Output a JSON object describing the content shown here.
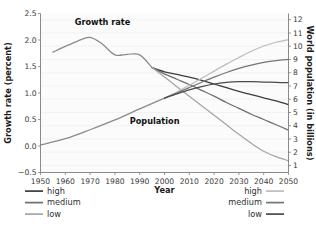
{
  "chart_data": {
    "type": "line",
    "title": "",
    "xlabel": "Year",
    "ylabel": "Growth rate (percent)",
    "y2label": "World population (in billions)",
    "xlim": [
      1950,
      2050
    ],
    "ylim": [
      -0.5,
      2.5
    ],
    "y2lim": [
      0.4705882353,
      12.4705882353
    ],
    "xticks": [
      1950,
      1960,
      1970,
      1980,
      1990,
      2000,
      2010,
      2020,
      2030,
      2040,
      2050
    ],
    "xticklabels": [
      "1950",
      "1960",
      "1970",
      "1980",
      "1990",
      "2000",
      "2010",
      "2020",
      "2030",
      "2040",
      "2050"
    ],
    "yticks": [
      -0.5,
      0.0,
      0.5,
      1.0,
      1.5,
      2.0,
      2.5
    ],
    "yticklabels": [
      "−0.5",
      "0.0",
      "0.5",
      "1.0",
      "1.5",
      "2.0",
      "2.5"
    ],
    "y2ticks": [
      1,
      2,
      3,
      4,
      5,
      6,
      7,
      8,
      9,
      10,
      11,
      12
    ],
    "y2ticklabels": [
      "1",
      "2",
      "3",
      "4",
      "5",
      "6",
      "7",
      "8",
      "9",
      "10",
      "11",
      "12"
    ],
    "grid": "horizontal",
    "annotations": [
      {
        "text": "Growth rate",
        "x": 1975,
        "y": 2.28
      },
      {
        "text": "Population",
        "x": 1996,
        "y": 0.42
      }
    ],
    "series": [
      {
        "name": "growth-rate-historic",
        "group": "growth_rate",
        "variant": "historic",
        "axis": "left",
        "color": "#8a8a8a",
        "x": [
          1955,
          1960,
          1965,
          1970,
          1975,
          1980,
          1985,
          1990,
          1995
        ],
        "values": [
          1.77,
          1.88,
          1.98,
          2.05,
          1.92,
          1.72,
          1.73,
          1.72,
          1.48
        ]
      },
      {
        "name": "growth-rate-high",
        "group": "growth_rate",
        "variant": "high",
        "axis": "left",
        "color": "#3c3c3c",
        "x": [
          1995,
          2000,
          2005,
          2010,
          2015,
          2020,
          2025,
          2030,
          2035,
          2040,
          2045,
          2050
        ],
        "values": [
          1.48,
          1.4,
          1.35,
          1.3,
          1.24,
          1.17,
          1.1,
          1.03,
          0.97,
          0.91,
          0.85,
          0.78
        ]
      },
      {
        "name": "growth-rate-medium",
        "group": "growth_rate",
        "variant": "medium",
        "axis": "left",
        "color": "#6e6e6e",
        "x": [
          1995,
          2000,
          2005,
          2010,
          2015,
          2020,
          2025,
          2030,
          2035,
          2040,
          2045,
          2050
        ],
        "values": [
          1.48,
          1.36,
          1.26,
          1.16,
          1.05,
          0.94,
          0.82,
          0.71,
          0.6,
          0.5,
          0.4,
          0.3
        ]
      },
      {
        "name": "growth-rate-low",
        "group": "growth_rate",
        "variant": "low",
        "axis": "left",
        "color": "#a4a4a4",
        "x": [
          1995,
          2000,
          2005,
          2010,
          2015,
          2020,
          2025,
          2030,
          2035,
          2040,
          2045,
          2050
        ],
        "values": [
          1.48,
          1.3,
          1.12,
          0.94,
          0.76,
          0.58,
          0.4,
          0.22,
          0.05,
          -0.1,
          -0.2,
          -0.28
        ]
      },
      {
        "name": "population-historic",
        "group": "population",
        "variant": "historic",
        "axis": "right",
        "color": "#8a8a8a",
        "x": [
          1950,
          1960,
          1970,
          1980,
          1990,
          2000
        ],
        "values": [
          2.55,
          3.02,
          3.7,
          4.44,
          5.27,
          6.08
        ]
      },
      {
        "name": "population-high",
        "group": "population",
        "variant": "high",
        "axis": "right",
        "color": "#bdbdbd",
        "x": [
          2000,
          2005,
          2010,
          2015,
          2020,
          2025,
          2030,
          2035,
          2040,
          2045,
          2050
        ],
        "values": [
          6.08,
          6.55,
          7.05,
          7.58,
          8.12,
          8.65,
          9.15,
          9.62,
          10.02,
          10.3,
          10.5
        ]
      },
      {
        "name": "population-medium",
        "group": "population",
        "variant": "medium",
        "axis": "right",
        "color": "#757575",
        "x": [
          2000,
          2005,
          2010,
          2015,
          2020,
          2025,
          2030,
          2035,
          2040,
          2045,
          2050
        ],
        "values": [
          6.08,
          6.47,
          6.88,
          7.28,
          7.67,
          8.02,
          8.33,
          8.58,
          8.78,
          8.92,
          9.0
        ]
      },
      {
        "name": "population-low",
        "group": "population",
        "variant": "low",
        "axis": "right",
        "color": "#4a4a4a",
        "x": [
          2000,
          2005,
          2010,
          2015,
          2020,
          2025,
          2030,
          2035,
          2040,
          2045,
          2050
        ],
        "values": [
          6.08,
          6.4,
          6.7,
          6.95,
          7.15,
          7.27,
          7.33,
          7.33,
          7.3,
          7.27,
          7.25
        ]
      }
    ]
  },
  "legend_left": {
    "name": "growth-rate-legend",
    "items": [
      {
        "label": "high",
        "color": "#3c3c3c"
      },
      {
        "label": "medium",
        "color": "#6e6e6e"
      },
      {
        "label": "low",
        "color": "#a4a4a4"
      }
    ]
  },
  "legend_right": {
    "name": "population-legend",
    "items": [
      {
        "label": "high",
        "color": "#bdbdbd"
      },
      {
        "label": "medium",
        "color": "#757575"
      },
      {
        "label": "low",
        "color": "#4a4a4a"
      }
    ]
  }
}
